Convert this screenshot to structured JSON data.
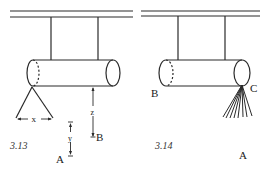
{
  "figures": [
    {
      "number": "3.13",
      "labels": {
        "x": "x",
        "y": "y",
        "z": "z",
        "A": "A",
        "B": "B"
      }
    },
    {
      "number": "3.14",
      "labels": {
        "B": "B",
        "C": "C",
        "A": "A"
      }
    }
  ],
  "colors": {
    "line": "#2a2a2a",
    "background": "#ffffff"
  }
}
